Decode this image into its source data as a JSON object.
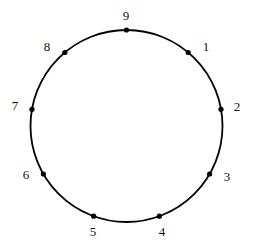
{
  "figure": {
    "title": "",
    "background_color": "#ffffff",
    "stroke_color": "#000000",
    "point_color": "#000000",
    "label_color": "#111111"
  },
  "chart_data": {
    "type": "scatter",
    "title": "",
    "subtitle": "",
    "xlabel": "",
    "ylabel": "",
    "grid": false,
    "legend": null,
    "geometry": {
      "shape": "circle",
      "center_x": 126.5,
      "center_y": 126,
      "radius": 96,
      "stroke_width": 1.8,
      "point_radius": 2.6,
      "point_count": 9,
      "angular_step_degrees": 40,
      "start_angle_degrees": -90,
      "direction": "clockwise"
    },
    "categories": [
      "1",
      "2",
      "3",
      "4",
      "5",
      "6",
      "7",
      "8",
      "9"
    ],
    "points": [
      {
        "label": "1",
        "angle_deg": -50,
        "x": 188.2,
        "y": 52.5,
        "label_x": 206,
        "label_y": 46
      },
      {
        "label": "2",
        "angle_deg": -10,
        "x": 221.0,
        "y": 109.3,
        "label_x": 237,
        "label_y": 106
      },
      {
        "label": "3",
        "angle_deg": 30,
        "x": 209.6,
        "y": 174.0,
        "label_x": 227,
        "label_y": 176
      },
      {
        "label": "4",
        "angle_deg": 70,
        "x": 159.3,
        "y": 216.2,
        "label_x": 162,
        "label_y": 231
      },
      {
        "label": "5",
        "angle_deg": 110,
        "x": 93.7,
        "y": 216.2,
        "label_x": 93,
        "label_y": 231
      },
      {
        "label": "6",
        "angle_deg": 150,
        "x": 43.4,
        "y": 174.0,
        "label_x": 26,
        "label_y": 174
      },
      {
        "label": "7",
        "angle_deg": 190,
        "x": 32.0,
        "y": 109.3,
        "label_x": 15,
        "label_y": 105
      },
      {
        "label": "8",
        "angle_deg": 230,
        "x": 64.8,
        "y": 52.5,
        "label_x": 47,
        "label_y": 46
      },
      {
        "label": "9",
        "angle_deg": 270,
        "x": 126.5,
        "y": 30.0,
        "label_x": 126,
        "label_y": 15
      }
    ]
  }
}
